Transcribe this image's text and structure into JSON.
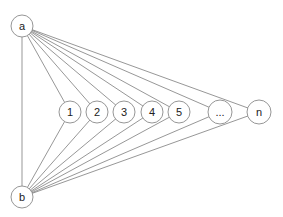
{
  "diagram": {
    "type": "bipartite-graph",
    "nodes": {
      "a": {
        "label": "a",
        "x": 22,
        "y": 26,
        "r": 11
      },
      "b": {
        "label": "b",
        "x": 22,
        "y": 197,
        "r": 11
      },
      "middle": [
        {
          "label": "1",
          "x": 70,
          "y": 112,
          "r": 11
        },
        {
          "label": "2",
          "x": 97,
          "y": 112,
          "r": 11
        },
        {
          "label": "3",
          "x": 124,
          "y": 112,
          "r": 11
        },
        {
          "label": "4",
          "x": 152,
          "y": 112,
          "r": 11
        },
        {
          "label": "5",
          "x": 179,
          "y": 112,
          "r": 11
        },
        {
          "label": "...",
          "x": 220,
          "y": 112,
          "r": 12
        },
        {
          "label": "n",
          "x": 259,
          "y": 112,
          "r": 12
        }
      ]
    },
    "edges": "a connects to b and to every middle node; b connects to every middle node",
    "colors": {
      "stroke": "#8a8a8a",
      "edge": "#6a6a6a",
      "text": "#222222",
      "background": "#ffffff"
    }
  }
}
